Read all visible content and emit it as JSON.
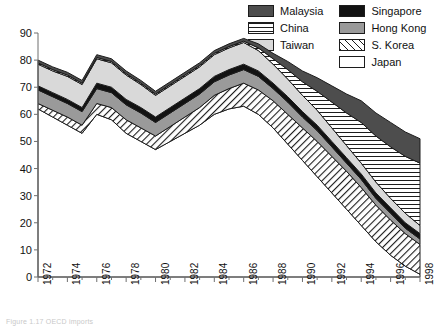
{
  "legend": {
    "position": "top-right",
    "columns": 2,
    "entries": [
      {
        "label": "Malaysia",
        "swatch": "solid-dark",
        "color": "#4d4d4d"
      },
      {
        "label": "Singapore",
        "swatch": "solid-black",
        "color": "#121212"
      },
      {
        "label": "China",
        "swatch": "horizontal-lines",
        "color": "#ffffff"
      },
      {
        "label": "Hong Kong",
        "swatch": "solid-mid",
        "color": "#9a9a9a"
      },
      {
        "label": "Taiwan",
        "swatch": "solid-light",
        "color": "#d9d9d9"
      },
      {
        "label": "S. Korea",
        "swatch": "diagonal-hatch",
        "color": "#ffffff"
      },
      {
        "label": "Japan",
        "swatch": "white",
        "color": "#ffffff"
      }
    ]
  },
  "axes": {
    "y_ticks": [
      0,
      10,
      20,
      30,
      40,
      50,
      60,
      70,
      80,
      90
    ],
    "x_ticks_major": [
      1972,
      1974,
      1976,
      1978,
      1980,
      1982,
      1984,
      1986,
      1988,
      1990,
      1992,
      1994,
      1996,
      1998
    ],
    "ylim": [
      0,
      90
    ],
    "xlim": [
      1972,
      1998
    ]
  },
  "footnote": "Figure 1.17  OECD imports",
  "chart_data": {
    "type": "area",
    "title": "",
    "xlabel": "",
    "ylabel": "",
    "ylim": [
      0,
      90
    ],
    "xlim": [
      1972,
      1998
    ],
    "grid": false,
    "stacked": true,
    "legend_position": "top-right",
    "x": [
      1972,
      1973,
      1974,
      1975,
      1976,
      1977,
      1978,
      1979,
      1980,
      1981,
      1982,
      1983,
      1984,
      1985,
      1986,
      1987,
      1988,
      1989,
      1990,
      1991,
      1992,
      1993,
      1994,
      1995,
      1996,
      1997,
      1998
    ],
    "stack_order_bottom_to_top": [
      "Japan",
      "S. Korea",
      "Hong Kong",
      "Singapore",
      "Taiwan",
      "China",
      "Malaysia"
    ],
    "series": [
      {
        "name": "Japan",
        "fill": "white",
        "values": [
          62,
          59,
          56,
          53,
          60,
          58,
          53,
          50,
          47,
          50,
          53,
          56,
          60,
          62,
          63,
          60,
          55,
          49,
          43,
          37,
          31,
          25,
          19,
          13,
          8,
          4,
          1
        ]
      },
      {
        "name": "S. Korea",
        "fill": "diagonal-hatch",
        "values": [
          2,
          2.5,
          3,
          3,
          4,
          4.5,
          5,
          5,
          5,
          5.5,
          6,
          6.5,
          7,
          7.5,
          8.5,
          9,
          10,
          11,
          12,
          13,
          13.5,
          14,
          14,
          13.5,
          13,
          12,
          11
        ]
      },
      {
        "name": "Hong Kong",
        "fill": "solid-mid",
        "values": [
          5,
          5,
          5,
          5,
          5.5,
          5.5,
          5.5,
          5.5,
          5,
          5,
          5,
          5,
          5,
          5,
          5,
          5,
          4.5,
          4.5,
          4,
          4,
          3.5,
          3,
          3,
          2.5,
          2.5,
          2,
          2
        ]
      },
      {
        "name": "Singapore",
        "fill": "solid-black",
        "values": [
          1.5,
          1.5,
          1.5,
          1.5,
          2,
          2,
          2,
          2,
          2,
          2,
          2,
          2,
          2,
          2,
          2,
          2,
          2,
          2,
          2,
          2,
          2,
          2,
          2,
          2,
          2,
          2,
          2
        ]
      },
      {
        "name": "Taiwan",
        "fill": "solid-light",
        "values": [
          8,
          8,
          8.5,
          8.5,
          9,
          9,
          9,
          8.5,
          8,
          8,
          8,
          8,
          8,
          8,
          8,
          7.5,
          7,
          6.5,
          6,
          5.5,
          5,
          4.5,
          4,
          4,
          3.5,
          3.5,
          3
        ]
      },
      {
        "name": "China",
        "fill": "horizontal-lines",
        "values": [
          0.5,
          0.5,
          0.5,
          0.5,
          0.5,
          0.5,
          0.5,
          0.5,
          0.5,
          0.5,
          0.5,
          0.5,
          0.5,
          0.5,
          0.5,
          1,
          2,
          3.5,
          5,
          7,
          9.5,
          12,
          15,
          17,
          19,
          21,
          23
        ]
      },
      {
        "name": "Malaysia",
        "fill": "solid-dark",
        "values": [
          1,
          1,
          1,
          1,
          1,
          1,
          1,
          1,
          1,
          1,
          1,
          1,
          1,
          1,
          1,
          1.5,
          2,
          3,
          4,
          5,
          6,
          7,
          8,
          8.5,
          9,
          9,
          9
        ]
      }
    ]
  }
}
